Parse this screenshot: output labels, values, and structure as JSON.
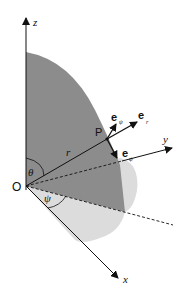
{
  "figure": {
    "type": "spherical-coordinates-diagram",
    "axes": {
      "z_label": "z",
      "y_label": "y",
      "x_label": "x"
    },
    "origin_label": "O",
    "point_label": "P",
    "radius_label": "r",
    "angles": {
      "polar": "θ",
      "azimuth": "ψ"
    },
    "unit_vectors": {
      "e_r": {
        "base": "e",
        "sub": "r"
      },
      "e_theta": {
        "base": "e",
        "sub": "ψ"
      },
      "e_psi": {
        "base": "e",
        "sub": "ψ"
      }
    },
    "colors": {
      "dark_region": "#8c8c8c",
      "light_region": "#dcdcdc",
      "lines": "#111111"
    }
  }
}
